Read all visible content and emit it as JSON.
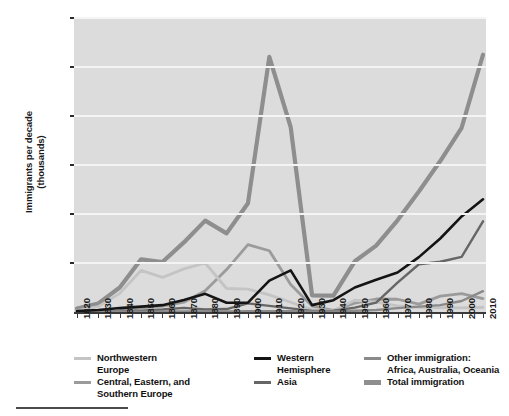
{
  "chart_data": {
    "type": "line",
    "title": "",
    "xlabel": "",
    "ylabel": "Immigrants per decade (thousands)",
    "ylabel_line1": "Immigrants per decade",
    "ylabel_line2": "(thousands)",
    "xlim": [
      1820,
      2010
    ],
    "ylim": [
      0,
      1200
    ],
    "grid": true,
    "legend_position": "bottom",
    "x": [
      1820,
      1830,
      1840,
      1850,
      1860,
      1870,
      1880,
      1890,
      1900,
      1910,
      1920,
      1930,
      1940,
      1950,
      1960,
      1970,
      1980,
      1990,
      2000,
      2010
    ],
    "xtick_labels": [
      "1820",
      "1830",
      "1840",
      "1850",
      "1860",
      "1870",
      "1880",
      "1890",
      "1900",
      "1910",
      "1920",
      "1930",
      "1940",
      "1950",
      "1960",
      "1970",
      "1980",
      "1990",
      "2000",
      "2010"
    ],
    "ytick_labels": [
      "200",
      "400",
      "600",
      "800",
      "1,000",
      "1,200"
    ],
    "ytick_values": [
      200,
      400,
      600,
      800,
      1000,
      1200
    ],
    "series": [
      {
        "name": "Northwestern Europe",
        "color": "#bfbfbf",
        "width": 3,
        "values": [
          8,
          80,
          380,
          1260,
          1080,
          1520,
          2600,
          1600,
          1400,
          1000,
          480,
          90,
          30,
          480,
          400,
          220,
          140,
          130,
          120,
          110
        ]
      },
      {
        "name": "Central, Eastern, and Southern Europe",
        "color": "#9a9a9a",
        "width": 3,
        "values": [
          3,
          6,
          12,
          40,
          70,
          190,
          840,
          1950,
          5800,
          3100,
          1200,
          200,
          30,
          300,
          500,
          450,
          230,
          590,
          690,
          470
        ]
      },
      {
        "name": "Western Hemisphere",
        "color": "#111111",
        "width": 2.6,
        "values": [
          10,
          16,
          50,
          60,
          80,
          170,
          400,
          40,
          40,
          1100,
          1500,
          160,
          350,
          1000,
          1350,
          1900,
          3600,
          4500,
          4700,
          4800
        ]
      },
      {
        "name": "Asia",
        "color": "#6e6e6e",
        "width": 2.6,
        "values": [
          0,
          0,
          0,
          40,
          65,
          125,
          70,
          75,
          320,
          250,
          110,
          20,
          30,
          150,
          430,
          1600,
          2800,
          2900,
          2600,
          3900
        ]
      },
      {
        "name": "Other immigration: Africa, Australia, Oceania",
        "color": "#8f8f8f",
        "width": 2.6,
        "values": [
          0,
          0,
          0,
          0,
          0,
          0,
          0,
          0,
          0,
          0,
          0,
          0,
          0,
          0,
          0,
          0,
          0,
          0,
          0,
          0
        ]
      },
      {
        "name": "Total immigration",
        "color": "#8c8c8c",
        "width": 4.5,
        "values": [
          0,
          0,
          0,
          0,
          0,
          0,
          0,
          0,
          0,
          0,
          0,
          0,
          0,
          0,
          0,
          0,
          0,
          0,
          0,
          0
        ]
      }
    ],
    "series_plotted": {
      "northwestern_europe": [
        6,
        22,
        76,
        170,
        141,
        176,
        200,
        96,
        93,
        70,
        40,
        10,
        5,
        48,
        40,
        25,
        19,
        18,
        17,
        19
      ],
      "central_eastern_southern_europe": [
        2,
        3,
        6,
        17,
        24,
        40,
        87,
        173,
        275,
        250,
        112,
        24,
        7,
        36,
        53,
        52,
        32,
        65,
        75,
        55
      ],
      "western_hemisphere": [
        4,
        8,
        16,
        22,
        28,
        49,
        74,
        38,
        38,
        128,
        170,
        28,
        48,
        100,
        132,
        161,
        224,
        300,
        390,
        460
      ],
      "asia": [
        1,
        1,
        1,
        5,
        10,
        17,
        10,
        12,
        35,
        25,
        15,
        4,
        5,
        18,
        38,
        120,
        195,
        205,
        225,
        370
      ],
      "other_africa_australia_oceania": [
        1,
        1,
        1,
        1,
        1,
        2,
        2,
        2,
        3,
        3,
        3,
        2,
        2,
        5,
        8,
        16,
        22,
        28,
        45,
        85
      ],
      "total_immigration": [
        14,
        35,
        100,
        215,
        204,
        284,
        373,
        321,
        444,
        1041,
        755,
        68,
        67,
        207,
        271,
        374,
        492,
        616,
        752,
        1050
      ]
    },
    "plot_series_order": [
      "total_immigration",
      "central_eastern_southern_europe",
      "northwestern_europe",
      "asia",
      "other_africa_australia_oceania",
      "western_hemisphere"
    ],
    "colors": {
      "northwestern_europe": "#c4c4c4",
      "central_eastern_southern_europe": "#9b9b9b",
      "western_hemisphere": "#141414",
      "asia": "#666666",
      "other_africa_australia_oceania": "#8a8a8a",
      "total_immigration": "#8e8e8e",
      "plot_background": "#dcdcdc",
      "gridline": "#f5f5f5",
      "axis": "#333333",
      "text": "#111111"
    }
  },
  "legend": {
    "items": [
      {
        "label": "Northwestern\nEurope",
        "key": "northwestern_europe",
        "color": "#c4c4c4",
        "thick": false
      },
      {
        "label": "Central, Eastern, and\nSouthern Europe",
        "key": "central_eastern_southern_europe",
        "color": "#9b9b9b",
        "thick": false
      },
      {
        "label": "Western\nHemisphere",
        "key": "western_hemisphere",
        "color": "#141414",
        "thick": false
      },
      {
        "label": "Asia",
        "key": "asia",
        "color": "#666666",
        "thick": false
      },
      {
        "label": "Other immigration:\nAfrica, Australia, Oceania",
        "key": "other_africa_australia_oceania",
        "color": "#8a8a8a",
        "thick": false
      },
      {
        "label": "Total immigration",
        "key": "total_immigration",
        "color": "#8e8e8e",
        "thick": true
      }
    ]
  }
}
